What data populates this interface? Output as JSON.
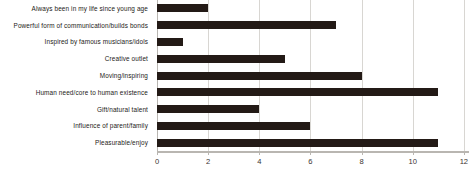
{
  "chart_data": {
    "type": "bar",
    "orientation": "horizontal",
    "title": "",
    "subtitle": "",
    "xlabel": "",
    "ylabel": "",
    "xlim": [
      0,
      12.2
    ],
    "grid": true,
    "legend": false,
    "bar_color": "#231a16",
    "gridline_color": "#d8d6d2",
    "axis_color": "#b9b6b1",
    "xticks": [
      0,
      2,
      4,
      6,
      8,
      10,
      12
    ],
    "xtick_labels": [
      "0",
      "2",
      "4",
      "6",
      "8",
      "10",
      "12"
    ],
    "categories": [
      "Always been in my life since young age",
      "Powerful form of communication/builds bonds",
      "Inspired by famous musicians/idols",
      "Creative outlet",
      "Moving/inspiring",
      "Human need/core to human existence",
      "Gift/natural talent",
      "Influence of parent/family",
      "Pleasurable/enjoy"
    ],
    "values": [
      2,
      7,
      1,
      5,
      8,
      11,
      4,
      6,
      11
    ]
  }
}
